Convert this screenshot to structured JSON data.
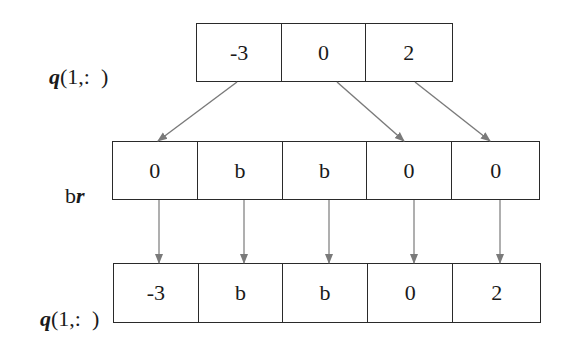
{
  "diagram": {
    "top_row": {
      "label_var": "q",
      "label_rest": "(1,:  )",
      "cells": [
        "-3",
        "0",
        "2"
      ]
    },
    "middle_row": {
      "label_plain": "b",
      "label_var": "r",
      "cells": [
        "0",
        "b",
        "b",
        "0",
        "0"
      ]
    },
    "bottom_row": {
      "label_var": "q",
      "label_rest": "(1,:  )",
      "cells": [
        "-3",
        "b",
        "b",
        "0",
        "2"
      ]
    },
    "mapping_top_to_middle": [
      {
        "from_index": 0,
        "to_index": 0
      },
      {
        "from_index": 1,
        "to_index": 3
      },
      {
        "from_index": 2,
        "to_index": 4
      }
    ],
    "mapping_middle_to_bottom": [
      {
        "from_index": 0,
        "to_index": 0
      },
      {
        "from_index": 1,
        "to_index": 1
      },
      {
        "from_index": 2,
        "to_index": 2
      },
      {
        "from_index": 3,
        "to_index": 3
      },
      {
        "from_index": 4,
        "to_index": 4
      }
    ],
    "colors": {
      "box_border": "#2a2a2a",
      "arrow": "#7a7a7a",
      "text": "#1a1a1a"
    }
  }
}
